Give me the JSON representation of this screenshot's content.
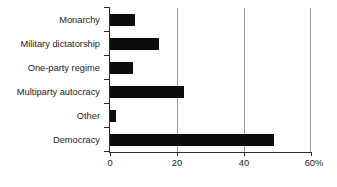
{
  "chart_data": {
    "type": "bar",
    "orientation": "horizontal",
    "title": "",
    "subtitle": "",
    "xlabel": "",
    "ylabel": "",
    "categories": [
      "Monarchy",
      "Military dictatorship",
      "One-party regime",
      "Multiparty autocracy",
      "Other",
      "Democracy"
    ],
    "values": [
      7.5,
      14.5,
      6.8,
      22.0,
      1.8,
      49.0
    ],
    "series": [
      {
        "name": "Share of countries",
        "values": [
          7.5,
          14.5,
          6.8,
          22.0,
          1.8,
          49.0
        ]
      }
    ],
    "xlim": [
      0,
      60
    ],
    "ylim": [
      0,
      6
    ],
    "x_ticks": [
      0,
      20,
      40,
      60
    ],
    "x_tick_labels": [
      "0",
      "20",
      "40",
      "60%"
    ],
    "grid": "vertical",
    "gridlines_at": [
      20,
      40,
      60
    ],
    "legend": "none",
    "legend_position": "none",
    "bar_color": "#0d0d0d",
    "gridline_color": "#9b9b9b",
    "axis_color": "#2b2b2b",
    "background_color": "#ffffff",
    "units": "percent"
  },
  "axis": {
    "x_tick_labels": [
      "0",
      "20",
      "40",
      "60%"
    ]
  },
  "categories": {
    "0": "Monarchy",
    "1": "Military dictatorship",
    "2": "One-party regime",
    "3": "Multiparty autocracy",
    "4": "Other",
    "5": "Democracy"
  }
}
